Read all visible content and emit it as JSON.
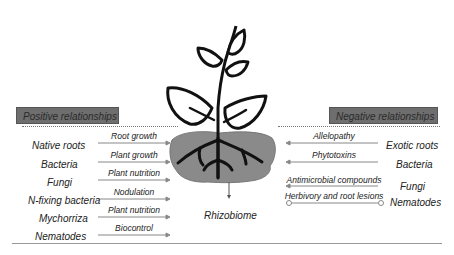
{
  "headers": {
    "positive": "Positive relationships",
    "negative": "Negative relationships"
  },
  "center_label": "Rhizobiome",
  "positive": [
    {
      "organism": "Native roots",
      "effect": "Root growth"
    },
    {
      "organism": "Bacteria",
      "effect": "Plant growth"
    },
    {
      "organism": "Fungi",
      "effect": "Plant nutrition"
    },
    {
      "organism": "N-fixing bacteria",
      "effect": "Nodulation"
    },
    {
      "organism": "Mychorriza",
      "effect": "Plant nutrition"
    },
    {
      "organism": "Nematodes",
      "effect": "Biocontrol"
    }
  ],
  "negative": [
    {
      "organism": "Exotic roots",
      "effect": "Allelopathy"
    },
    {
      "organism": "Bacteria",
      "effect": "Phytotoxins"
    },
    {
      "organism": "Fungi",
      "effect": "Antimicrobial compounds"
    },
    {
      "organism": "Nematodes",
      "effect": "Herbivory and root lesions"
    }
  ],
  "colors": {
    "header_fill": "#6e6e6e",
    "soil_fill": "#8a8a8a",
    "plant_stroke": "#111111"
  }
}
